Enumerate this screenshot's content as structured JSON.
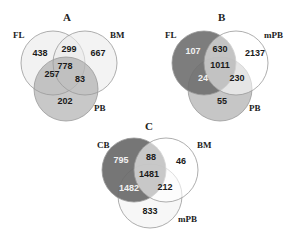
{
  "diagrams": [
    {
      "title": "A",
      "sets": [
        "FL",
        "BM",
        "PB"
      ],
      "regions": {
        "FL_only": "438",
        "FL_BM": "299",
        "BM_only": "667",
        "FL_BM_PB": "778",
        "FL_PB": "257",
        "BM_PB": "83",
        "PB_only": "202"
      }
    },
    {
      "title": "B",
      "sets": [
        "FL",
        "mPB",
        "PB"
      ],
      "regions": {
        "FL_only": "107",
        "FL_mPB": "630",
        "mPB_only": "2137",
        "FL_mPB_PB": "1011",
        "FL_PB": "24",
        "mPB_PB": "230",
        "PB_only": "55"
      }
    },
    {
      "title": "C",
      "sets": [
        "CB",
        "BM",
        "mPB"
      ],
      "regions": {
        "CB_only": "795",
        "CB_BM": "88",
        "BM_only": "46",
        "CB_BM_mPB": "1481",
        "CB_mPB": "1482",
        "BM_mPB": "212",
        "mPB_only": "833"
      }
    }
  ],
  "colors": {
    "A_FL": "#f0f0f0",
    "A_BM": "#eeeeee",
    "A_PB": "#b8b8b8",
    "B_FL": "#7a7a7a",
    "B_mPB": "#ffffff",
    "B_PB": "#c8c8c8",
    "C_CB": "#6e6e6e",
    "C_BM": "#ffffff",
    "C_mPB": "#f8f8f8",
    "stroke": "#888888"
  }
}
